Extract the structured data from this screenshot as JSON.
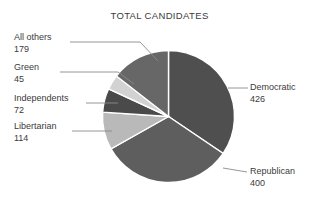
{
  "chart_data": {
    "type": "pie",
    "title": "TOTAL CANDIDATES",
    "xlabel": "",
    "ylabel": "",
    "total": 1236,
    "legend_position": "callout-labels",
    "grid": false,
    "categories": [
      "Democratic",
      "Republican",
      "Libertarian",
      "Independents",
      "Green",
      "All others"
    ],
    "values": [
      426,
      400,
      114,
      72,
      45,
      179
    ],
    "slice_colors": [
      "#4f4f4f",
      "#5e5e5e",
      "#b9b9b9",
      "#4a4a4a",
      "#d2d2d2",
      "#676767"
    ],
    "start_angle_deg": 0,
    "direction": "clockwise",
    "slices": [
      {
        "label": "Democratic",
        "value": 426,
        "color": "#4f4f4f",
        "side": "right"
      },
      {
        "label": "Republican",
        "value": 400,
        "color": "#5e5e5e",
        "side": "right"
      },
      {
        "label": "Libertarian",
        "value": 114,
        "color": "#b9b9b9",
        "side": "left"
      },
      {
        "label": "Independents",
        "value": 72,
        "color": "#4a4a4a",
        "side": "left"
      },
      {
        "label": "Green",
        "value": 45,
        "color": "#d2d2d2",
        "side": "left"
      },
      {
        "label": "All others",
        "value": 179,
        "color": "#676767",
        "side": "left"
      }
    ]
  },
  "labels": {
    "all_others": {
      "name": "All others",
      "value": "179"
    },
    "green": {
      "name": "Green",
      "value": "45"
    },
    "independents": {
      "name": "Independents",
      "value": "72"
    },
    "libertarian": {
      "name": "Libertarian",
      "value": "114"
    },
    "democratic": {
      "name": "Democratic",
      "value": "426"
    },
    "republican": {
      "name": "Republican",
      "value": "400"
    }
  },
  "colors": {
    "background": "#ffffff",
    "text": "#3b3b3b",
    "leader_line": "#8a8a8a",
    "slice_divider": "#ffffff"
  }
}
